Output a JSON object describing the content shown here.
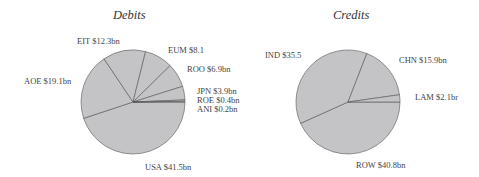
{
  "chart_data": [
    {
      "type": "pie",
      "title": "Debits",
      "categories": [
        "USA",
        "AOE",
        "EIT",
        "EUM",
        "ROO",
        "JPN",
        "ROE",
        "ANI"
      ],
      "values": [
        41.5,
        19.1,
        12.3,
        8.1,
        6.9,
        3.9,
        0.4,
        0.2
      ],
      "unit": "$bn",
      "labels": [
        "USA $41.5bn",
        "AOE $19.1bn",
        "EIT $12.3bn",
        "EUM $8.1",
        "ROO $6.9bn",
        "JPN $3.9bn",
        "ROE $0.4bn",
        "ANI $0.2bn"
      ],
      "slice_color": "#c4c4c6",
      "legend": "none"
    },
    {
      "type": "pie",
      "title": "Credits",
      "categories": [
        "ROW",
        "IND",
        "CHN",
        "LAM"
      ],
      "values": [
        40.8,
        35.5,
        15.9,
        2.1
      ],
      "unit": "$bn",
      "labels": [
        "ROW $40.8bn",
        "IND $35.5",
        "CHN $15.9bn",
        "LAM $2.1br"
      ],
      "slice_color": "#c4c4c6",
      "legend": "none"
    }
  ]
}
